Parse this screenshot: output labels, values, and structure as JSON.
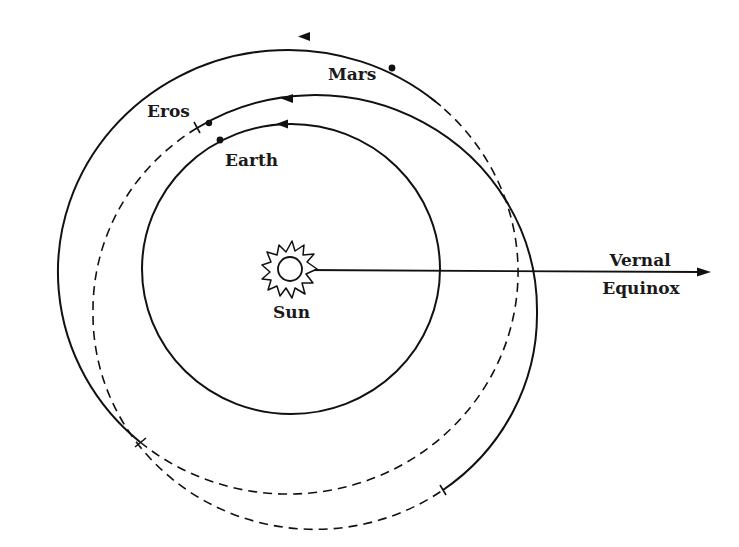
{
  "diagram": {
    "labels": {
      "mars": "Mars",
      "eros": "Eros",
      "earth": "Earth",
      "sun": "Sun",
      "vernal": "Vernal",
      "equinox": "Equinox"
    },
    "orbits": [
      {
        "name": "Earth",
        "style": "solid",
        "direction": "counterclockwise"
      },
      {
        "name": "Eros",
        "style": "solid (upper/right) + dashed (left/bottom)",
        "direction": "counterclockwise"
      },
      {
        "name": "Mars",
        "style": "solid (upper/left) + dashed (bottom/right)",
        "direction": "counterclockwise"
      }
    ],
    "reference_direction": "Vernal Equinox",
    "colors": {
      "ink": "#111111",
      "background": "#ffffff"
    }
  }
}
